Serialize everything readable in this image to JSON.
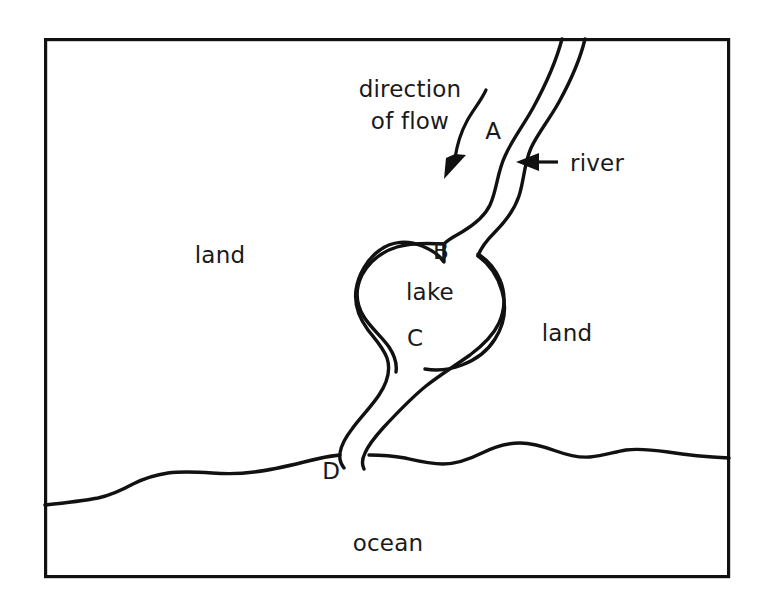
{
  "diagram": {
    "type": "cross-section-map",
    "frame": {
      "x": 44,
      "y": 38,
      "width": 686,
      "height": 540,
      "stroke_color": "#111111"
    },
    "regions": [
      {
        "id": "land-left",
        "label": "land",
        "x": 220,
        "y": 255
      },
      {
        "id": "land-right",
        "label": "land",
        "x": 567,
        "y": 333
      },
      {
        "id": "lake",
        "label": "lake",
        "x": 430,
        "y": 292
      },
      {
        "id": "ocean",
        "label": "ocean",
        "x": 388,
        "y": 543
      }
    ],
    "points": [
      {
        "id": "A",
        "label": "A",
        "x": 493,
        "y": 130,
        "description": "river upstream above the lake"
      },
      {
        "id": "B",
        "label": "B",
        "x": 441,
        "y": 250,
        "description": "river entering the lake"
      },
      {
        "id": "C",
        "label": "C",
        "x": 415,
        "y": 337,
        "description": "river leaving the lake"
      },
      {
        "id": "D",
        "label": "D",
        "x": 331,
        "y": 470,
        "description": "river mouth at the ocean"
      }
    ],
    "annotations": [
      {
        "id": "direction-of-flow",
        "line1": "direction",
        "line2": "of flow",
        "line1_x": 410,
        "line1_y": 97,
        "line2_x": 410,
        "line2_y": 129,
        "arrow": "curved-arrow-pointing-down-left"
      },
      {
        "id": "river-callout",
        "label": "river",
        "label_x": 570,
        "label_y": 170,
        "arrow": "straight-arrow-pointing-left"
      }
    ],
    "colors": {
      "ink": "#111111",
      "text": "#1a1a1a",
      "background": "#ffffff"
    }
  }
}
